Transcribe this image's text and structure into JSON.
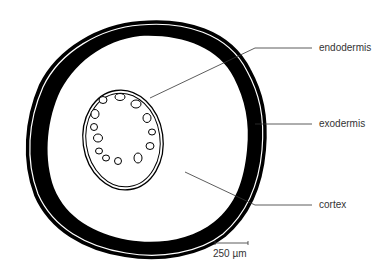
{
  "diagram": {
    "labels": [
      {
        "id": "endodermis",
        "text": "endodermis"
      },
      {
        "id": "exodermis",
        "text": "exodermis"
      },
      {
        "id": "cortex",
        "text": "cortex"
      }
    ],
    "scale_bar": {
      "text": "250 µm"
    },
    "colors": {
      "line": "#000000",
      "background": "#ffffff",
      "label": "#333333"
    }
  }
}
